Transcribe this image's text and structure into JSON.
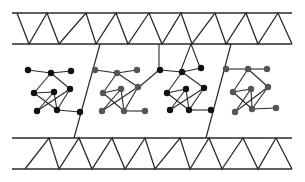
{
  "diagram": {
    "width": 305,
    "height": 182,
    "colors": {
      "background": "#ffffff",
      "line": "#2a2a2a",
      "node_dark": "#111111",
      "node_gray": "#555555"
    },
    "top_band": {
      "upper_y": 13,
      "lower_y": 44,
      "x_start": 12,
      "x_end": 292,
      "zigzag": [
        [
          17,
          13
        ],
        [
          29,
          44
        ],
        [
          47,
          13
        ],
        [
          59,
          44
        ],
        [
          86,
          13
        ],
        [
          96,
          44
        ],
        [
          116,
          13
        ],
        [
          128,
          44
        ],
        [
          149,
          13
        ],
        [
          162,
          44
        ],
        [
          181,
          13
        ],
        [
          192,
          44
        ],
        [
          215,
          13
        ],
        [
          226,
          44
        ],
        [
          246,
          13
        ],
        [
          258,
          44
        ],
        [
          278,
          13
        ],
        [
          292,
          44
        ]
      ]
    },
    "bottom_band": {
      "upper_y": 138,
      "lower_y": 169,
      "x_start": 12,
      "x_end": 292,
      "zigzag": [
        [
          25,
          169
        ],
        [
          49,
          138
        ],
        [
          59,
          169
        ],
        [
          79,
          138
        ],
        [
          92,
          169
        ],
        [
          112,
          138
        ],
        [
          125,
          169
        ],
        [
          145,
          138
        ],
        [
          155,
          169
        ],
        [
          180,
          138
        ],
        [
          190,
          169
        ],
        [
          209,
          138
        ],
        [
          222,
          169
        ],
        [
          243,
          138
        ],
        [
          258,
          169
        ],
        [
          276,
          138
        ],
        [
          292,
          169
        ]
      ]
    },
    "dividers": [
      {
        "x1": 100,
        "y1": 44,
        "x2": 74,
        "y2": 138
      },
      {
        "x1": 231,
        "y1": 44,
        "x2": 206,
        "y2": 138
      }
    ],
    "links": [
      {
        "x1": 159,
        "y1": 44,
        "x2": 159,
        "y2": 70
      },
      {
        "x1": 191,
        "y1": 44,
        "x2": 181,
        "y2": 70
      },
      {
        "x1": 191,
        "y1": 44,
        "x2": 201,
        "y2": 70
      },
      {
        "x1": 159,
        "y1": 70,
        "x2": 138,
        "y2": 88
      },
      {
        "x1": 231,
        "y1": 44,
        "x2": 226,
        "y2": 44
      }
    ],
    "molecules": [
      {
        "name": "molecule-1",
        "node_color": "#111111",
        "nodes": [
          [
            28,
            70
          ],
          [
            51,
            73
          ],
          [
            71,
            71
          ],
          [
            34,
            93
          ],
          [
            54,
            92
          ],
          [
            70,
            89
          ],
          [
            37,
            111
          ],
          [
            57,
            110
          ],
          [
            80,
            112
          ]
        ],
        "bonds": [
          [
            0,
            1
          ],
          [
            1,
            2
          ],
          [
            1,
            3
          ],
          [
            1,
            5
          ],
          [
            3,
            4
          ],
          [
            4,
            7
          ],
          [
            3,
            7
          ],
          [
            5,
            6
          ],
          [
            5,
            7
          ],
          [
            7,
            8
          ],
          [
            4,
            6
          ]
        ]
      },
      {
        "name": "molecule-2",
        "node_color": "#555555",
        "nodes": [
          [
            95,
            70
          ],
          [
            117,
            73
          ],
          [
            137,
            70
          ],
          [
            103,
            93
          ],
          [
            121,
            89
          ],
          [
            138,
            87
          ],
          [
            102,
            111
          ],
          [
            124,
            111
          ],
          [
            145,
            111
          ]
        ],
        "bonds": [
          [
            0,
            1
          ],
          [
            1,
            2
          ],
          [
            1,
            3
          ],
          [
            1,
            5
          ],
          [
            3,
            4
          ],
          [
            4,
            7
          ],
          [
            3,
            7
          ],
          [
            5,
            6
          ],
          [
            5,
            7
          ],
          [
            7,
            8
          ],
          [
            4,
            6
          ]
        ]
      },
      {
        "name": "molecule-3",
        "node_color": "#111111",
        "nodes": [
          [
            160,
            70
          ],
          [
            182,
            72
          ],
          [
            201,
            68
          ],
          [
            167,
            93
          ],
          [
            186,
            89
          ],
          [
            204,
            88
          ],
          [
            170,
            110
          ],
          [
            189,
            110
          ],
          [
            211,
            110
          ]
        ],
        "bonds": [
          [
            0,
            1
          ],
          [
            1,
            2
          ],
          [
            1,
            3
          ],
          [
            1,
            5
          ],
          [
            3,
            4
          ],
          [
            4,
            7
          ],
          [
            3,
            7
          ],
          [
            5,
            6
          ],
          [
            5,
            7
          ],
          [
            7,
            8
          ],
          [
            4,
            6
          ]
        ]
      },
      {
        "name": "molecule-4",
        "node_color": "#555555",
        "nodes": [
          [
            226,
            69
          ],
          [
            248,
            69
          ],
          [
            267,
            69
          ],
          [
            233,
            92
          ],
          [
            251,
            89
          ],
          [
            268,
            87
          ],
          [
            235,
            112
          ],
          [
            252,
            109
          ],
          [
            276,
            108
          ]
        ],
        "bonds": [
          [
            0,
            1
          ],
          [
            1,
            2
          ],
          [
            1,
            3
          ],
          [
            1,
            5
          ],
          [
            3,
            4
          ],
          [
            4,
            7
          ],
          [
            3,
            7
          ],
          [
            5,
            6
          ],
          [
            5,
            7
          ],
          [
            7,
            8
          ],
          [
            4,
            6
          ]
        ]
      }
    ]
  }
}
